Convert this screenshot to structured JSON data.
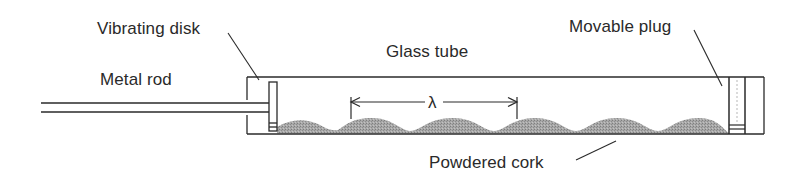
{
  "diagram": {
    "labels": {
      "vibrating_disk": "Vibrating disk",
      "metal_rod": "Metal rod",
      "glass_tube": "Glass tube",
      "movable_plug": "Movable plug",
      "powdered_cork": "Powdered cork",
      "wavelength_symbol": "λ"
    },
    "colors": {
      "line": "#2a2a2a",
      "cork_fill": "#9a9a9a",
      "background": "#ffffff"
    },
    "components": [
      {
        "id": "metal-rod",
        "label_key": "metal_rod"
      },
      {
        "id": "vibrating-disk",
        "label_key": "vibrating_disk"
      },
      {
        "id": "glass-tube",
        "label_key": "glass_tube"
      },
      {
        "id": "movable-plug",
        "label_key": "movable_plug"
      },
      {
        "id": "powdered-cork",
        "label_key": "powdered_cork"
      },
      {
        "id": "wavelength-marker",
        "label_key": "wavelength_symbol"
      }
    ],
    "cork_wave": {
      "peaks": 5,
      "note": "Cork powder piles into regularly spaced heaps; one wavelength spans two heap intervals"
    }
  }
}
